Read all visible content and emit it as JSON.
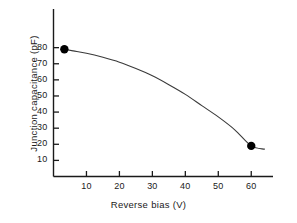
{
  "chart_data": {
    "type": "line",
    "title": "",
    "xlabel": "Reverse bias (V)",
    "ylabel": "Junction capacitance (pF)",
    "xlim": [
      0,
      66.6
    ],
    "ylim": [
      0,
      104
    ],
    "xticks": [
      10,
      20,
      30,
      40,
      50,
      60
    ],
    "yticks": [
      10,
      20,
      30,
      40,
      50,
      60,
      70,
      80
    ],
    "xtick_labels": [
      "10",
      "20",
      "30",
      "40",
      "50",
      "60"
    ],
    "ytick_labels": [
      "10",
      "20",
      "30",
      "40",
      "50",
      "60",
      "70",
      "80"
    ],
    "grid": false,
    "legend": null,
    "series": [
      {
        "name": "Junction capacitance vs reverse bias",
        "line_color": "#3a3a3a",
        "marker_color": "#000000",
        "x": [
          3.3,
          6,
          10,
          15,
          20,
          25,
          30,
          35,
          40,
          45,
          50,
          55,
          60,
          64
        ],
        "y": [
          79,
          78,
          76.5,
          74,
          71,
          67,
          62.5,
          57,
          51,
          44,
          37,
          29,
          19,
          17
        ]
      }
    ],
    "markers": [
      {
        "x": 3.3,
        "y": 79,
        "label": "low-bias-data-point"
      },
      {
        "x": 60,
        "y": 19,
        "label": "high-bias-data-point"
      }
    ],
    "axis_color": "#1a1a1a",
    "background": "#ffffff"
  }
}
